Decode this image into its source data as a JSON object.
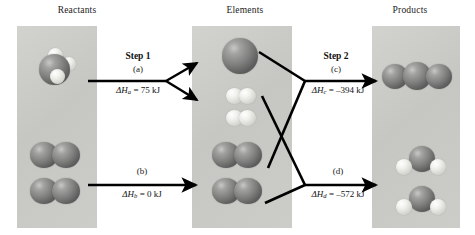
{
  "figure": {
    "type": "reaction-energy-diagram"
  },
  "columns": [
    {
      "id": "reactants",
      "title": "Reactants"
    },
    {
      "id": "elements",
      "title": "Elements"
    },
    {
      "id": "products",
      "title": "Products"
    }
  ],
  "steps": [
    {
      "id": "step1",
      "title": "Step 1",
      "sub": "(a)",
      "delta_prefix": "ΔH",
      "delta_sub": "a",
      "delta_value": "= 75 kJ",
      "full": "ΔHa = 75 kJ"
    },
    {
      "id": "stepb",
      "title": "",
      "sub": "(b)",
      "delta_prefix": "ΔH",
      "delta_sub": "b",
      "delta_value": "= 0 kJ",
      "full": "ΔHb = 0 kJ"
    },
    {
      "id": "step2",
      "title": "Step 2",
      "sub": "(c)",
      "delta_prefix": "ΔH",
      "delta_sub": "c",
      "delta_value": "= –394 kJ",
      "full": "ΔHc = –394 kJ"
    },
    {
      "id": "stepd",
      "title": "",
      "sub": "(d)",
      "delta_prefix": "ΔH",
      "delta_sub": "d",
      "delta_value": "= –572 kJ",
      "full": "ΔHd = –572 kJ"
    }
  ],
  "molecules": {
    "reactants": [
      {
        "name": "methane",
        "formula": "CH4",
        "atoms": "1 dark carbon with 3 visible light hydrogens"
      },
      {
        "name": "dioxygen-1",
        "formula": "O2",
        "atoms": "2 dark oxygen spheres"
      },
      {
        "name": "dioxygen-2",
        "formula": "O2",
        "atoms": "2 dark oxygen spheres"
      }
    ],
    "elements": [
      {
        "name": "carbon-atom",
        "formula": "C",
        "atoms": "1 large dark sphere"
      },
      {
        "name": "dihydrogen-1",
        "formula": "H2",
        "atoms": "2 light spheres"
      },
      {
        "name": "dihydrogen-2",
        "formula": "H2",
        "atoms": "2 light spheres"
      },
      {
        "name": "dioxygen-1",
        "formula": "O2",
        "atoms": "2 dark oxygen spheres"
      },
      {
        "name": "dioxygen-2",
        "formula": "O2",
        "atoms": "2 dark oxygen spheres"
      }
    ],
    "products": [
      {
        "name": "carbon-dioxide",
        "formula": "CO2",
        "atoms": "3 dark spheres in a row"
      },
      {
        "name": "water-1",
        "formula": "H2O",
        "atoms": "1 dark oxygen with 2 light hydrogens"
      },
      {
        "name": "water-2",
        "formula": "H2O",
        "atoms": "1 dark oxygen with 2 light hydrogens"
      }
    ]
  },
  "colors": {
    "panel": "#c9c9c7",
    "atom_dark": "#6e6e6d",
    "atom_light": "#eeeeea",
    "stroke": "#000000",
    "background": "#ffffff"
  }
}
